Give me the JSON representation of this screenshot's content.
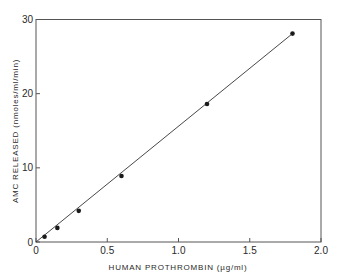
{
  "chart_data": {
    "type": "line",
    "title": "",
    "xlabel": "HUMAN  PROTHROMBIN (µg/ml)",
    "ylabel": "AMC  RELEASED  (nmoles/ml/min)",
    "xlim": [
      0,
      2.0
    ],
    "ylim": [
      0,
      30
    ],
    "x_ticks": [
      "0",
      "0.5",
      "1.0",
      "1.5",
      "2.0"
    ],
    "y_ticks": [
      "0",
      "10",
      "20",
      "30"
    ],
    "grid": false,
    "legend": null,
    "series": [
      {
        "name": "AMC released",
        "x": [
          0.06,
          0.15,
          0.3,
          0.6,
          1.2,
          1.8
        ],
        "y": [
          0.7,
          1.9,
          4.2,
          8.9,
          18.6,
          28.1
        ],
        "marker": "circle",
        "line": "linear fit through origin"
      }
    ],
    "fit_line": {
      "x": [
        0,
        1.8
      ],
      "y": [
        0,
        28.1
      ]
    }
  },
  "colors": {
    "ink": "#1a1a1a",
    "axis": "#444444",
    "background": "#ffffff"
  }
}
